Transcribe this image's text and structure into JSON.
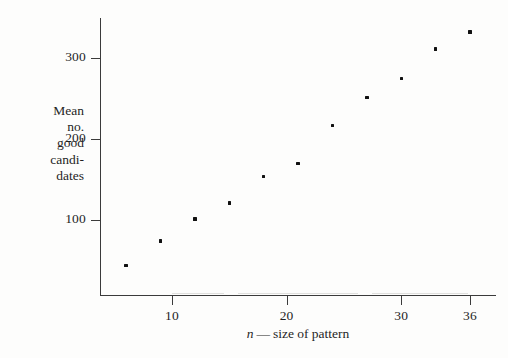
{
  "figure": {
    "background_color": "#fdfdfc",
    "axis_color": "#3b3b3b",
    "marker_color": "#111111"
  },
  "chart_data": {
    "type": "scatter",
    "title": "",
    "xlabel": "n — size of pattern",
    "xlabel_variable": "n",
    "xlabel_dash": "—",
    "xlabel_rest": "size of pattern",
    "ylabel": "Mean no. good candidates",
    "ylabel_lines": [
      "Mean",
      "no.",
      "good",
      "candi-",
      "dates"
    ],
    "xlim": [
      4,
      38
    ],
    "ylim": [
      0,
      345
    ],
    "grid": false,
    "legend": null,
    "xticks": [
      10,
      20,
      30,
      36
    ],
    "xtick_labels": [
      "10",
      "20",
      "30",
      "36"
    ],
    "yticks": [
      100,
      200,
      300
    ],
    "ytick_labels": [
      "100",
      "200",
      "300"
    ],
    "x": [
      6,
      9,
      12,
      15,
      18,
      21,
      24,
      27,
      30,
      33,
      36
    ],
    "y": [
      44,
      74,
      101,
      121,
      154,
      170,
      217,
      251,
      275,
      311,
      332
    ],
    "points": [
      {
        "x": 6,
        "y": 44
      },
      {
        "x": 9,
        "y": 74
      },
      {
        "x": 12,
        "y": 101
      },
      {
        "x": 15,
        "y": 121
      },
      {
        "x": 18,
        "y": 154
      },
      {
        "x": 21,
        "y": 170
      },
      {
        "x": 24,
        "y": 217
      },
      {
        "x": 27,
        "y": 251
      },
      {
        "x": 30,
        "y": 275
      },
      {
        "x": 33,
        "y": 311
      },
      {
        "x": 36,
        "y": 332
      }
    ]
  }
}
